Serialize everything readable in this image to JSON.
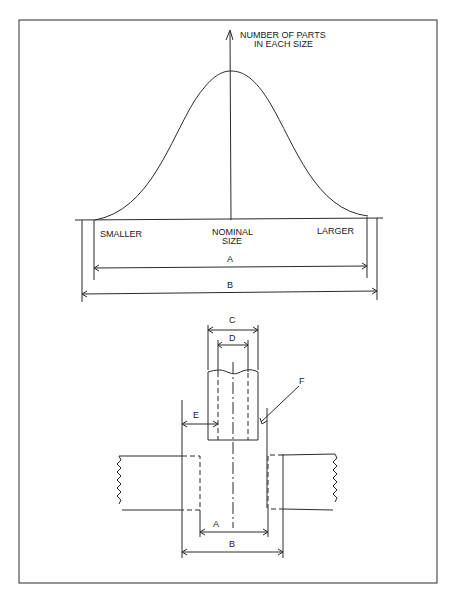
{
  "figure": {
    "distribution": {
      "y_axis_label_line1": "NUMBER OF PARTS",
      "y_axis_label_line2": "IN EACH SIZE",
      "x_left_label": "SMALLER",
      "x_center_label_line1": "NOMINAL",
      "x_center_label_line2": "SIZE",
      "x_right_label": "LARGER",
      "dimension_a": "A",
      "dimension_b": "B"
    },
    "fit": {
      "dimension_c": "C",
      "dimension_d": "D",
      "dimension_e": "E",
      "dimension_f": "F",
      "dimension_a": "A",
      "dimension_b": "B"
    }
  }
}
